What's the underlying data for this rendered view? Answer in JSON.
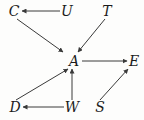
{
  "diagram": {
    "type": "directed-graph",
    "width": 144,
    "height": 120,
    "background_color": "#fdfdfc",
    "edge_color": "#3a3a3a",
    "label_color": "#1b1b1b",
    "nodes": [
      {
        "id": "C",
        "label": "C",
        "x": 14,
        "y": 11
      },
      {
        "id": "U",
        "label": "U",
        "x": 67,
        "y": 11
      },
      {
        "id": "T",
        "label": "T",
        "x": 107,
        "y": 11
      },
      {
        "id": "A",
        "label": "A",
        "x": 74,
        "y": 61
      },
      {
        "id": "E",
        "label": "E",
        "x": 134,
        "y": 61
      },
      {
        "id": "D",
        "label": "D",
        "x": 15,
        "y": 107
      },
      {
        "id": "W",
        "label": "W",
        "x": 72,
        "y": 107
      },
      {
        "id": "S",
        "label": "S",
        "x": 100,
        "y": 107
      }
    ],
    "edges": [
      {
        "id": "U-C",
        "from": "U",
        "to": "C",
        "x1": 60,
        "y1": 11,
        "x2": 22,
        "y2": 11
      },
      {
        "id": "C-A",
        "from": "C",
        "to": "A",
        "x1": 17,
        "y1": 19,
        "x2": 63,
        "y2": 52
      },
      {
        "id": "T-A",
        "from": "T",
        "to": "A",
        "x1": 105,
        "y1": 19,
        "x2": 78,
        "y2": 52
      },
      {
        "id": "A-E",
        "from": "A",
        "to": "E",
        "x1": 82,
        "y1": 61,
        "x2": 127,
        "y2": 61
      },
      {
        "id": "D-A",
        "from": "D",
        "to": "A",
        "x1": 16,
        "y1": 100,
        "x2": 68,
        "y2": 69
      },
      {
        "id": "W-A",
        "from": "W",
        "to": "A",
        "x1": 72,
        "y1": 100,
        "x2": 72,
        "y2": 69
      },
      {
        "id": "W-D",
        "from": "W",
        "to": "D",
        "x1": 64,
        "y1": 107,
        "x2": 23,
        "y2": 107
      },
      {
        "id": "S-E",
        "from": "S",
        "to": "E",
        "x1": 100,
        "y1": 100,
        "x2": 128,
        "y2": 69
      }
    ]
  }
}
